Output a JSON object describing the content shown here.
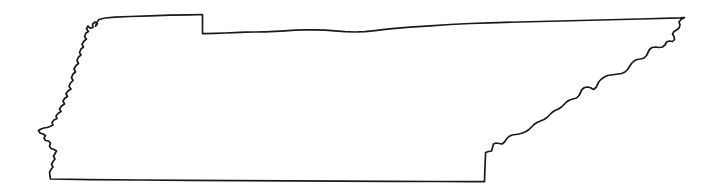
{
  "figure": {
    "kind": "outline-map",
    "subject": "Tennessee",
    "title": "Tennessee State Outline Map",
    "caption": "",
    "labels": [],
    "legend": [],
    "annotations": [],
    "background_color": "#ffffff",
    "canvas_width": 717,
    "canvas_height": 193
  },
  "map": {
    "region_name": "Tennessee",
    "region_type": "U.S. state",
    "projection_note": "unlabeled outline, no graticule",
    "fill_color": "#ffffff",
    "stroke_color": "#1a1a1a",
    "stroke_width": 1.7,
    "has_interior_divisions": false,
    "has_labels": false,
    "has_scale_bar": false,
    "has_compass_rose": false,
    "borders": [
      {
        "name": "northern-border",
        "description": "Kentucky and Virginia line, nearly straight east-west with a single rectangular offset step near the western third"
      },
      {
        "name": "eastern-border",
        "description": "Appalachian ridgeline with North Carolina, jagged diagonal running from northeast down to the southeast corner"
      },
      {
        "name": "southern-border",
        "description": "Straight line along the 35th parallel shared with Georgia, Alabama and Mississippi"
      },
      {
        "name": "western-border",
        "description": "Mississippi River boundary with Missouri and Arkansas, highly sinuous with meander loops including the Kentucky Bend notch at the north"
      }
    ],
    "extreme_points": {
      "northeast_corner": [
        685,
        17
      ],
      "northwest_notch": [
        95,
        26
      ],
      "westernmost_point": [
        38,
        130
      ],
      "southwest_corner": [
        50,
        179
      ],
      "southeast_corner": [
        688,
        78
      ],
      "north_step_x": 202
    },
    "outline_path": "M 95.5 26.2 L 97.5 23.8 L 95.0 22.0 L 92.5 24.2 L 93.0 27.5 L 90.0 28.2 L 88.0 26.0 L 86.5 29.0 L 88.5 31.5 L 86.0 33.0 L 84.5 36.5 L 86.5 39.0 L 84.0 41.0 L 82.0 44.5 L 83.5 47.0 L 81.0 49.0 L 79.5 52.5 L 81.0 55.0 L 78.5 57.0 L 77.0 60.5 L 78.5 63.5 L 76.0 65.5 L 74.0 69.0 L 75.5 72.0 L 73.0 74.0 L 71.5 77.5 L 73.0 80.5 L 70.5 83.0 L 69.0 86.5 L 71.0 89.0 L 68.0 91.0 L 66.0 93.5 L 67.5 96.5 L 65.0 98.0 L 63.0 101.0 L 64.5 104.0 L 61.5 106.0 L 59.5 109.0 L 61.0 111.5 L 58.0 113.5 L 56.0 116.0 L 57.0 118.5 L 54.0 120.0 L 52.0 122.5 L 53.0 125.0 L 50.0 126.5 L 47.0 127.5 L 44.0 128.0 L 41.0 129.0 L 38.5 130.5 L 40.0 133.0 L 43.0 134.0 L 45.5 135.5 L 44.0 138.0 L 45.5 140.5 L 48.5 141.0 L 50.5 143.0 L 49.5 146.0 L 51.0 148.5 L 54.0 149.5 L 56.5 151.0 L 55.0 153.5 L 53.5 156.5 L 55.0 159.0 L 53.0 161.5 L 51.5 164.5 L 53.0 167.0 L 51.0 169.5 L 49.5 172.5 L 50.0 176.0 L 50.5 179.0 L 90.0 179.6 L 140.0 180.0 L 190.0 180.3 L 240.0 180.6 L 290.0 180.9 L 340.0 181.1 L 390.0 181.3 L 440.0 181.5 L 470.0 181.6 L 484.5 181.6 L 484.8 172.0 L 485.2 162.0 L 485.6 152.5 L 488.5 151.5 L 491.5 151.0 L 492.5 147.5 L 493.5 144.0 L 496.0 143.0 L 499.0 143.5 L 502.0 144.0 L 504.5 142.0 L 506.5 139.0 L 509.0 136.5 L 512.0 135.0 L 515.5 134.5 L 519.0 134.0 L 522.5 133.0 L 526.0 131.5 L 529.0 129.5 L 531.5 127.0 L 534.0 124.5 L 537.0 122.5 L 540.5 121.0 L 544.0 119.5 L 547.0 117.5 L 549.5 115.0 L 552.0 112.5 L 555.0 110.5 L 558.5 109.0 L 561.5 107.0 L 564.0 104.5 L 566.5 102.0 L 569.5 100.0 L 573.0 99.0 L 576.5 98.0 L 579.0 95.5 L 580.5 92.5 L 582.0 89.5 L 584.5 87.5 L 588.0 87.0 L 591.0 88.0 L 593.5 89.5 L 596.0 87.5 L 597.5 84.5 L 599.0 81.5 L 601.5 79.0 L 604.5 77.0 L 607.5 75.5 L 611.0 75.0 L 614.5 74.5 L 618.0 74.0 L 621.5 73.5 L 625.0 72.0 L 627.5 69.5 L 629.5 66.5 L 631.5 63.5 L 634.0 61.0 L 637.0 59.5 L 640.5 59.0 L 644.0 58.0 L 646.5 55.5 L 648.0 52.5 L 649.5 49.5 L 652.0 47.5 L 655.5 47.0 L 659.0 47.5 L 662.5 47.0 L 665.0 45.0 L 666.5 42.0 L 669.5 41.0 L 672.5 41.5 L 674.5 39.5 L 674.0 36.5 L 672.5 34.0 L 674.0 31.5 L 676.5 30.0 L 679.0 28.0 L 680.0 25.0 L 679.0 22.0 L 681.0 19.5 L 684.5 17.5 L 680.0 17.9 L 640.0 19.0 L 600.0 20.0 L 560.0 21.0 L 520.0 22.0 L 490.0 22.8 L 470.0 23.5 L 450.0 24.5 L 430.0 25.8 L 410.0 27.2 L 395.0 28.4 L 385.0 29.4 L 375.0 30.6 L 365.0 31.6 L 355.0 32.0 L 345.0 31.6 L 335.0 30.8 L 325.0 30.2 L 315.0 29.8 L 305.0 29.8 L 295.0 30.2 L 285.0 30.8 L 275.0 31.4 L 265.0 31.8 L 255.0 32.0 L 245.0 32.2 L 235.0 32.6 L 225.0 33.0 L 215.0 33.4 L 205.0 33.6 L 202.5 33.6 L 202.5 25.0 L 202.5 14.5 L 190.0 14.8 L 170.0 15.2 L 150.0 15.8 L 130.0 16.5 L 115.0 17.2 L 105.0 18.0 L 99.0 19.5 L 97.0 22.0 Z"
  }
}
